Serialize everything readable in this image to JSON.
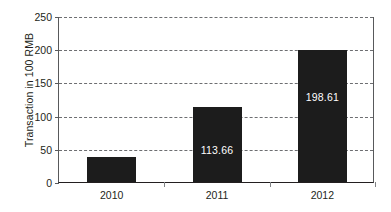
{
  "chart_data": {
    "type": "bar",
    "title": "",
    "xlabel": "",
    "ylabel": "Transaction in 100 RMB",
    "categories": [
      "2010",
      "2011",
      "2012"
    ],
    "values": [
      37.35,
      113.66,
      198.61
    ],
    "value_labels": [
      "37.35",
      "113.66",
      "198.61"
    ],
    "ylim": [
      0,
      250
    ],
    "yticks": [
      0,
      50,
      100,
      150,
      200,
      250
    ],
    "ytick_labels": [
      "0",
      "50",
      "100",
      "150",
      "200",
      "250"
    ],
    "grid": "horizontal-dashed",
    "legend": "none",
    "bar_color": "#1c1c1c",
    "value_label_color": "#ffffff",
    "gridline_color": "#6d6e71",
    "axis_color": "#231f20",
    "background": "#ffffff"
  }
}
